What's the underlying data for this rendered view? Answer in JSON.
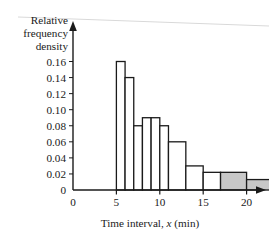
{
  "chart_data": {
    "type": "bar",
    "title": "",
    "subtitle": "",
    "xlabel": "Time interval, x (min)",
    "ylabel": "Relative frequency density",
    "ylabel_lines": [
      "Relative",
      "frequency",
      "density"
    ],
    "xlim": [
      0,
      26.5
    ],
    "ylim": [
      0,
      0.17
    ],
    "grid": false,
    "legend": null,
    "x_ticks": [
      0,
      5,
      10,
      15,
      20,
      25
    ],
    "x_tick_labels": [
      "0",
      "5",
      "10",
      "15",
      "20",
      "25"
    ],
    "y_ticks": [
      0,
      0.02,
      0.04,
      0.06,
      0.08,
      0.1,
      0.12,
      0.14,
      0.16
    ],
    "y_tick_labels": [
      "0",
      "0.02",
      "0.04",
      "0.06",
      "0.08",
      "0.10",
      "0.12",
      "0.14",
      "0.16"
    ],
    "bars": [
      {
        "label": "5-6",
        "x_start": 5,
        "x_end": 6,
        "value": 0.16,
        "shaded": false
      },
      {
        "label": "6-7",
        "x_start": 6,
        "x_end": 7,
        "value": 0.14,
        "shaded": false
      },
      {
        "label": "7-8",
        "x_start": 7,
        "x_end": 8,
        "value": 0.08,
        "shaded": false
      },
      {
        "label": "8-9",
        "x_start": 8,
        "x_end": 9,
        "value": 0.09,
        "shaded": false
      },
      {
        "label": "9-10",
        "x_start": 9,
        "x_end": 10,
        "value": 0.09,
        "shaded": false
      },
      {
        "label": "10-11",
        "x_start": 10,
        "x_end": 11,
        "value": 0.08,
        "shaded": false
      },
      {
        "label": "11-13",
        "x_start": 11,
        "x_end": 13,
        "value": 0.06,
        "shaded": false
      },
      {
        "label": "13-15",
        "x_start": 13,
        "x_end": 15,
        "value": 0.03,
        "shaded": false
      },
      {
        "label": "15-17",
        "x_start": 15,
        "x_end": 17,
        "value": 0.022,
        "shaded": false
      },
      {
        "label": "17-20",
        "x_start": 17,
        "x_end": 20,
        "value": 0.022,
        "shaded": true
      },
      {
        "label": "20-25",
        "x_start": 20,
        "x_end": 25,
        "value": 0.013,
        "shaded": true
      }
    ],
    "colors": {
      "axis": "#1a1a1a",
      "bar_edge": "#1a1a1a",
      "bar_fill_unshaded": "#ffffff",
      "bar_fill_shaded": "#c8c8c8",
      "background": "#ffffff",
      "top_rule": "#d9d9d9"
    }
  }
}
